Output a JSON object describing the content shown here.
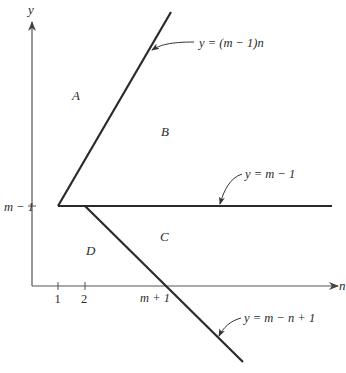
{
  "diagram": {
    "axes": {
      "x_label": "n",
      "y_label": "y"
    },
    "ticks": {
      "x": [
        {
          "label": "1",
          "x": 58
        },
        {
          "label": "2",
          "x": 85
        },
        {
          "label": "m + 1",
          "x": 165
        }
      ],
      "y": [
        {
          "label": "m − 1",
          "y": 206
        }
      ]
    },
    "regions": {
      "A": "A",
      "B": "B",
      "C": "C",
      "D": "D"
    },
    "lines": {
      "upper": {
        "label": "y = (m − 1)n"
      },
      "horizontal": {
        "label": "y = m − 1"
      },
      "lower": {
        "label": "y = m − n + 1"
      }
    },
    "colors": {
      "ink": "#2a2a2a",
      "axis": "#555555",
      "background": "#ffffff"
    }
  }
}
